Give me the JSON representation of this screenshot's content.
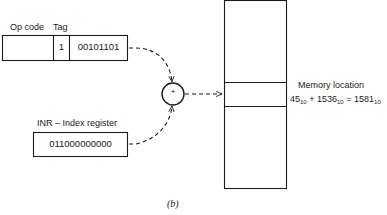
{
  "instruction": {
    "opcode_label": "Op code",
    "tag_label": "Tag",
    "opcode_value": "",
    "tag_value": "1",
    "address_value": "00101101"
  },
  "index_register": {
    "label": "INR – Index register",
    "value": "011000000000"
  },
  "adder": {
    "symbol": "+"
  },
  "memory": {
    "label": "Memory location",
    "equation": {
      "a": "45",
      "a_base": "10",
      "plus": "+",
      "b": "1536",
      "b_base": "10",
      "equals": "=",
      "result": "1581",
      "result_base": "10"
    }
  },
  "caption": "(b)",
  "colors": {
    "line": "#1a1a1a",
    "background": "#ffffff"
  }
}
